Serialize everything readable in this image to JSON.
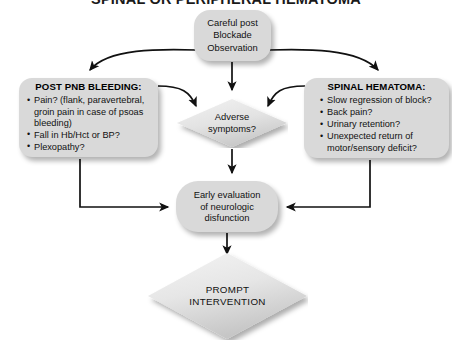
{
  "title": "SPINAL OR PERIPHERAL HEMATOMA",
  "colors": {
    "shape_fill": "#d9d9d9",
    "diamond_fill_light": "#ececec",
    "diamond_fill_dark": "#cfcfcf",
    "connector": "#111111",
    "text": "#111111",
    "background": "#ffffff"
  },
  "nodes": {
    "top": {
      "shape": "rounded-rectangle",
      "lines": [
        "Careful post",
        "Blockade",
        "Observation"
      ]
    },
    "left_panel": {
      "shape": "rounded-rectangle",
      "heading": "POST PNB BLEEDING:",
      "bullets": [
        {
          "text": "Pain? (flank, paravertebral,",
          "continuation": [
            "groin pain in case of psoas",
            "bleeding)"
          ]
        },
        {
          "text": "Fall in Hb/Hct or BP?",
          "continuation": []
        },
        {
          "text": "Plexopathy?",
          "continuation": []
        }
      ]
    },
    "right_panel": {
      "shape": "rounded-rectangle",
      "heading": "SPINAL HEMATOMA:",
      "bullets": [
        {
          "text": "Slow regression of block?",
          "continuation": []
        },
        {
          "text": "Back pain?",
          "continuation": []
        },
        {
          "text": "Urinary retention?",
          "continuation": []
        },
        {
          "text": "Unexpected return of",
          "continuation": [
            "motor/sensory deficit?"
          ]
        }
      ]
    },
    "decision_adverse": {
      "shape": "diamond",
      "lines": [
        "Adverse",
        "symptoms?"
      ]
    },
    "evaluation": {
      "shape": "rounded-rectangle",
      "lines": [
        "Early evaluation",
        "of neurologic",
        "disfunction"
      ]
    },
    "outcome": {
      "shape": "diamond",
      "lines": [
        "PROMPT",
        "INTERVENTION"
      ]
    }
  },
  "connectors": [
    {
      "from": "top",
      "to": "left_panel",
      "style": "curved-arrow"
    },
    {
      "from": "top",
      "to": "decision_adverse",
      "style": "straight-arrow"
    },
    {
      "from": "top",
      "to": "right_panel",
      "style": "curved-arrow"
    },
    {
      "from": "left_panel",
      "to": "decision_adverse",
      "style": "curved-arrow"
    },
    {
      "from": "right_panel",
      "to": "decision_adverse",
      "style": "curved-arrow"
    },
    {
      "from": "left_panel",
      "to": "evaluation",
      "style": "elbow-arrow"
    },
    {
      "from": "right_panel",
      "to": "evaluation",
      "style": "elbow-arrow"
    },
    {
      "from": "decision_adverse",
      "to": "evaluation",
      "style": "straight-arrow"
    },
    {
      "from": "evaluation",
      "to": "outcome",
      "style": "straight-arrow"
    }
  ]
}
